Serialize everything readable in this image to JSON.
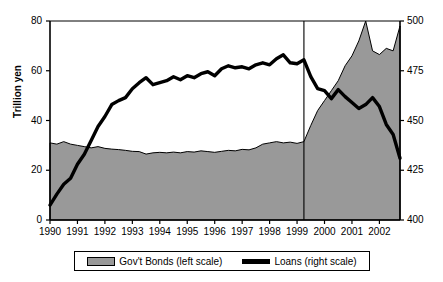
{
  "figure": {
    "caption_sliver": "",
    "background_color": "#ffffff",
    "plot_area": {
      "left": 50,
      "top": 21,
      "right": 400,
      "bottom": 220
    }
  },
  "axes": {
    "y_left": {
      "title": "Trillion yen",
      "ticks": [
        "0",
        "20",
        "40",
        "60",
        "80"
      ],
      "min": 0,
      "max": 80
    },
    "y_right": {
      "title": "",
      "ticks": [
        "400",
        "425",
        "450",
        "475",
        "500"
      ],
      "min": 400,
      "max": 500
    },
    "x": {
      "title": "",
      "ticks": [
        "1990",
        "1991",
        "1992",
        "1993",
        "1994",
        "1995",
        "1996",
        "1997",
        "1998",
        "1999",
        "2000",
        "2001",
        "2002"
      ],
      "min": 1990,
      "max": 2002.75
    }
  },
  "legend": {
    "position": "below-plot",
    "entries": [
      {
        "label": "Gov't Bonds (left scale)",
        "marker": "area-swatch",
        "color": "#999999"
      },
      {
        "label": "Loans (right scale)",
        "marker": "line-swatch",
        "color": "#000000"
      }
    ]
  },
  "annotations": [
    {
      "name": "vertical-divider-1999",
      "type": "vline",
      "x": 1999.25,
      "color": "#000000"
    }
  ],
  "colors": {
    "area_fill": "#999999",
    "line": "#000000",
    "axis": "#000000"
  },
  "chart_data": {
    "type": "area",
    "title": "",
    "xlabel": "",
    "ylabel": "Trillion yen",
    "ylim": [
      0,
      80
    ],
    "y2lim": [
      400,
      500
    ],
    "xlim": [
      1990,
      2002.75
    ],
    "grid": false,
    "legend_position": "bottom",
    "x": [
      1990.0,
      1990.25,
      1990.5,
      1990.75,
      1991.0,
      1991.25,
      1991.5,
      1991.75,
      1992.0,
      1992.25,
      1992.5,
      1992.75,
      1993.0,
      1993.25,
      1993.5,
      1993.75,
      1994.0,
      1994.25,
      1994.5,
      1994.75,
      1995.0,
      1995.25,
      1995.5,
      1995.75,
      1996.0,
      1996.25,
      1996.5,
      1996.75,
      1997.0,
      1997.25,
      1997.5,
      1997.75,
      1998.0,
      1998.25,
      1998.5,
      1998.75,
      1999.0,
      1999.25,
      1999.5,
      1999.75,
      2000.0,
      2000.25,
      2000.5,
      2000.75,
      2001.0,
      2001.25,
      2001.5,
      2001.75,
      2002.0,
      2002.25,
      2002.5,
      2002.75
    ],
    "series": [
      {
        "name": "Gov't Bonds (left scale)",
        "scale": "left",
        "units": "Trillion yen",
        "render": "area",
        "color": "#999999",
        "values": [
          31.0,
          30.5,
          31.5,
          30.5,
          30.0,
          29.5,
          29.0,
          29.5,
          28.8,
          28.5,
          28.3,
          28.0,
          27.6,
          27.5,
          26.5,
          27.0,
          27.2,
          27.0,
          27.3,
          27.0,
          27.5,
          27.3,
          27.8,
          27.5,
          27.2,
          27.6,
          28.0,
          27.8,
          28.4,
          28.2,
          29.0,
          30.5,
          31.0,
          31.5,
          31.0,
          31.3,
          30.8,
          31.5,
          38.0,
          44.0,
          48.0,
          52.0,
          56.0,
          62.0,
          66.0,
          72.0,
          80.0,
          68.0,
          66.5,
          69.0,
          68.0,
          78.0
        ]
      },
      {
        "name": "Loans (right scale)",
        "scale": "right",
        "units": "Trillion yen",
        "render": "line",
        "color": "#000000",
        "values": [
          407.5,
          413.0,
          418.0,
          421.0,
          428.0,
          433.0,
          440.0,
          447.0,
          452.0,
          458.0,
          460.0,
          461.5,
          466.0,
          469.0,
          471.5,
          468.0,
          469.0,
          470.0,
          472.0,
          470.5,
          472.5,
          471.5,
          473.5,
          474.5,
          472.5,
          476.0,
          477.5,
          476.5,
          477.0,
          476.0,
          478.0,
          479.0,
          478.0,
          481.0,
          483.0,
          479.0,
          478.5,
          480.5,
          472.0,
          466.0,
          465.0,
          461.0,
          465.5,
          462.0,
          459.0,
          456.0,
          458.0,
          461.5,
          457.0,
          448.0,
          443.0,
          431.0
        ]
      }
    ]
  }
}
